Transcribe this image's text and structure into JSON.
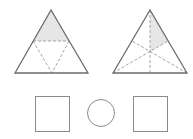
{
  "figure": {
    "colors": {
      "outline": "#6b6b6b",
      "dashed": "#9a9a9a",
      "shading": "#e6e6e6",
      "shape_stroke": "#8a8a8a"
    },
    "triangles": [
      {
        "name": "triangle-midline-division",
        "division": "midpoints connected",
        "parts": 4,
        "shaded_parts": 1,
        "shaded_region": "top"
      },
      {
        "name": "triangle-median-division",
        "division": "three medians",
        "parts": 6,
        "shaded_parts": 1,
        "shaded_region": "upper-right"
      }
    ],
    "shapes": [
      {
        "type": "rectangle",
        "name": "left-rectangle"
      },
      {
        "type": "circle",
        "name": "middle-circle"
      },
      {
        "type": "rectangle",
        "name": "right-rectangle"
      }
    ]
  }
}
